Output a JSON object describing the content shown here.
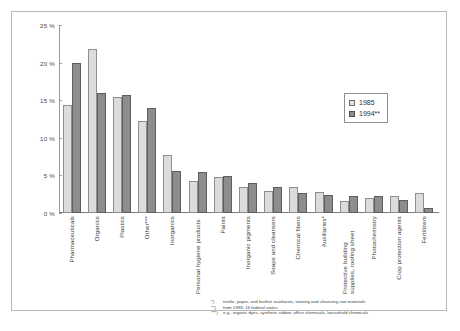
{
  "chart_data": {
    "type": "bar",
    "title": "",
    "xlabel": "",
    "ylabel": "",
    "ylim": [
      0,
      25
    ],
    "yticks": [
      "0 %",
      "5 %",
      "10 %",
      "15 %",
      "20 %",
      "25 %"
    ],
    "ytick_values": [
      0,
      5,
      10,
      15,
      20,
      25
    ],
    "grid": false,
    "legend_position": "top-right",
    "categories": [
      "Pharmaceuticals",
      "Organics",
      "Plastics",
      "Other***",
      "Inorganics",
      "Personal hygiene products",
      "Paints",
      "Inorganic pigments",
      "Soaps and cleansers",
      "Chemical fibers",
      "Auxiliaries*",
      "Protective building supplies, roofing sheet",
      "Photochemistry",
      "Crop protection agents",
      "Fertilizers"
    ],
    "series": [
      {
        "name": "1985",
        "color": "#dcdcdc",
        "values": [
          14.4,
          21.8,
          15.4,
          12.3,
          7.7,
          4.2,
          4.8,
          3.5,
          2.9,
          3.4,
          2.8,
          1.6,
          2.0,
          2.3,
          2.6
        ]
      },
      {
        "name": "1994**",
        "color": "#8d8d8d",
        "values": [
          19.9,
          15.9,
          15.7,
          13.9,
          5.6,
          5.4,
          4.9,
          4.0,
          3.5,
          2.7,
          2.4,
          2.2,
          2.2,
          1.7,
          0.7
        ]
      }
    ]
  },
  "legend": {
    "items": [
      {
        "label": "1985",
        "series": "1985"
      },
      {
        "label": "1994**",
        "series": "1994**"
      }
    ]
  },
  "footnotes": [
    {
      "marker": "*)",
      "text": "textile, paper, and leather auxiliaries, tanning and cleansing raw materials"
    },
    {
      "marker": "**)",
      "text": "from 1993: 16 federal states"
    },
    {
      "marker": "***)",
      "text": "e.g., organic dyes, synthetic rubber, office chemicals, household chemicals"
    }
  ]
}
